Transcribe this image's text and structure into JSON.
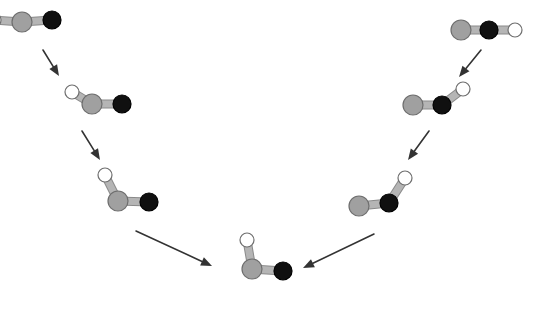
{
  "diagram": {
    "background_color": "#ffffff",
    "atom_types": [
      {
        "id": "gray",
        "name": "gray-atom",
        "fill": "#a0a0a0",
        "stroke": "#6e6e6e",
        "radius": 10
      },
      {
        "id": "black",
        "name": "black-atom",
        "fill": "#101010",
        "stroke": "#000000",
        "radius": 9
      },
      {
        "id": "white",
        "name": "white-atom",
        "fill": "#ffffff",
        "stroke": "#6e6e6e",
        "radius": 7
      }
    ],
    "bond": {
      "name": "bond",
      "color": "#b5b5b5",
      "edge_color": "#8a8a8a",
      "width": 7
    },
    "arrow": {
      "name": "reaction-arrow",
      "color": "#333333",
      "line_width": 1.6,
      "head_length": 11,
      "head_width": 9
    },
    "molecules": [
      {
        "id": "L1",
        "label": "left-step-1",
        "note": "linear, clipped at left edge",
        "atoms": [
          {
            "type": "white",
            "x": -6,
            "y": 20
          },
          {
            "type": "gray",
            "x": 22,
            "y": 22
          },
          {
            "type": "black",
            "x": 52,
            "y": 20
          }
        ],
        "bonds": [
          [
            0,
            1
          ],
          [
            1,
            2
          ]
        ]
      },
      {
        "id": "L2",
        "label": "left-step-2",
        "atoms": [
          {
            "type": "white",
            "x": 72,
            "y": 92
          },
          {
            "type": "gray",
            "x": 92,
            "y": 104
          },
          {
            "type": "black",
            "x": 122,
            "y": 104
          }
        ],
        "bonds": [
          [
            0,
            1
          ],
          [
            1,
            2
          ]
        ]
      },
      {
        "id": "L3",
        "label": "left-step-3",
        "atoms": [
          {
            "type": "white",
            "x": 105,
            "y": 175
          },
          {
            "type": "gray",
            "x": 118,
            "y": 201
          },
          {
            "type": "black",
            "x": 149,
            "y": 202
          }
        ],
        "bonds": [
          [
            0,
            1
          ],
          [
            1,
            2
          ]
        ]
      },
      {
        "id": "C",
        "label": "center-step-bent",
        "atoms": [
          {
            "type": "white",
            "x": 247,
            "y": 240
          },
          {
            "type": "gray",
            "x": 252,
            "y": 269
          },
          {
            "type": "black",
            "x": 283,
            "y": 271
          }
        ],
        "bonds": [
          [
            0,
            1
          ],
          [
            1,
            2
          ]
        ]
      },
      {
        "id": "R3",
        "label": "right-step-3",
        "atoms": [
          {
            "type": "gray",
            "x": 359,
            "y": 206
          },
          {
            "type": "black",
            "x": 389,
            "y": 203
          },
          {
            "type": "white",
            "x": 405,
            "y": 178
          }
        ],
        "bonds": [
          [
            0,
            1
          ],
          [
            1,
            2
          ]
        ]
      },
      {
        "id": "R2",
        "label": "right-step-2",
        "atoms": [
          {
            "type": "gray",
            "x": 413,
            "y": 105
          },
          {
            "type": "black",
            "x": 442,
            "y": 105
          },
          {
            "type": "white",
            "x": 463,
            "y": 89
          }
        ],
        "bonds": [
          [
            0,
            1
          ],
          [
            1,
            2
          ]
        ]
      },
      {
        "id": "R1",
        "label": "right-step-1",
        "atoms": [
          {
            "type": "gray",
            "x": 461,
            "y": 30
          },
          {
            "type": "black",
            "x": 489,
            "y": 30
          },
          {
            "type": "white",
            "x": 515,
            "y": 30
          }
        ],
        "bonds": [
          [
            0,
            1
          ],
          [
            1,
            2
          ]
        ]
      }
    ],
    "arrows": [
      {
        "id": "A1",
        "label": "arrow-left-1",
        "x1": 43,
        "y1": 50,
        "x2": 59,
        "y2": 76
      },
      {
        "id": "A2",
        "label": "arrow-left-2",
        "x1": 82,
        "y1": 131,
        "x2": 100,
        "y2": 160
      },
      {
        "id": "A3",
        "label": "arrow-left-3",
        "x1": 136,
        "y1": 231,
        "x2": 212,
        "y2": 266
      },
      {
        "id": "A4",
        "label": "arrow-right-1",
        "x1": 481,
        "y1": 50,
        "x2": 459,
        "y2": 77
      },
      {
        "id": "A5",
        "label": "arrow-right-2",
        "x1": 429,
        "y1": 131,
        "x2": 408,
        "y2": 160
      },
      {
        "id": "A6",
        "label": "arrow-right-3",
        "x1": 374,
        "y1": 234,
        "x2": 303,
        "y2": 268
      }
    ]
  }
}
